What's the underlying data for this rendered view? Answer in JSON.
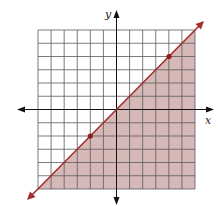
{
  "graph": {
    "type": "linear-inequality-graph",
    "x_axis_label": "x",
    "y_axis_label": "y",
    "grid": {
      "x_min": -6,
      "x_max": 6,
      "y_min": -6,
      "y_max": 6,
      "step": 1
    },
    "boundary_line": {
      "equation": "y = x",
      "style": "solid",
      "slope": 1,
      "intercept": 0
    },
    "shaded_region": "below the line (y ≤ x)",
    "plotted_points": [
      {
        "x": -2,
        "y": -2
      },
      {
        "x": 4,
        "y": 4
      }
    ],
    "colors": {
      "line": "#a32f2c",
      "shade": "#d6b8b8",
      "grid": "#5a5a5a",
      "axis": "#111111",
      "point": "#8e1f1c"
    }
  },
  "chart_data": {
    "type": "line",
    "title": "",
    "xlabel": "x",
    "ylabel": "y",
    "xlim": [
      -6,
      6
    ],
    "ylim": [
      -6,
      6
    ],
    "grid": true,
    "series": [
      {
        "name": "y = x",
        "x": [
          -6,
          6
        ],
        "y": [
          -6,
          6
        ]
      }
    ],
    "points": [
      {
        "x": -2,
        "y": -2
      },
      {
        "x": 4,
        "y": 4
      }
    ],
    "shading": "below boundary line"
  }
}
